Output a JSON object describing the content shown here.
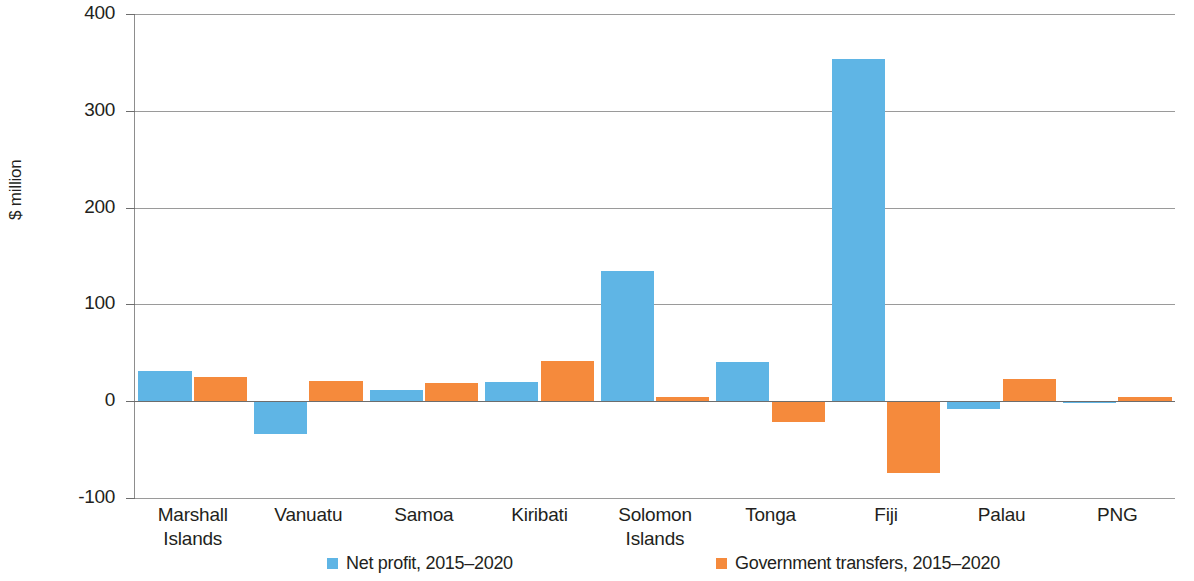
{
  "chart_data": {
    "type": "bar",
    "title": "",
    "subtitle": "",
    "xlabel": "",
    "ylabel": "$ million",
    "ylim": [
      -100,
      400
    ],
    "yticks": [
      400,
      300,
      200,
      100,
      0,
      -100
    ],
    "ytick_labels": [
      "400",
      "300",
      "200",
      "100",
      "0",
      "-100"
    ],
    "grid": true,
    "legend_position": "bottom",
    "categories": [
      "Marshall Islands",
      "Vanuatu",
      "Samoa",
      "Kiribati",
      "Solomon Islands",
      "Tonga",
      "Fiji",
      "Palau",
      "PNG"
    ],
    "category_lines": [
      [
        "Marshall",
        "Islands"
      ],
      [
        "Vanuatu"
      ],
      [
        "Samoa"
      ],
      [
        "Kiribati"
      ],
      [
        "Solomon",
        "Islands"
      ],
      [
        "Tonga"
      ],
      [
        "Fiji"
      ],
      [
        "Palau"
      ],
      [
        "PNG"
      ]
    ],
    "series": [
      {
        "name": "Net profit, 2015–2020",
        "color": "#5fb5e5",
        "values": [
          31,
          -34,
          12,
          20,
          134,
          41,
          353,
          -8,
          -1
        ]
      },
      {
        "name": "Government transfers, 2015–2020",
        "color": "#f58a3c",
        "values": [
          25,
          21,
          19,
          42,
          4,
          -21,
          -74,
          23,
          4
        ]
      }
    ]
  },
  "legend": {
    "items": [
      {
        "label": "Net profit, 2015–2020",
        "color": "#5fb5e5"
      },
      {
        "label": "Government transfers, 2015–2020",
        "color": "#f58a3c"
      }
    ]
  },
  "colors": {
    "net_profit": "#5fb5e5",
    "government_transfers": "#f58a3c",
    "axis": "#6d6d6d",
    "gridline": "#9a9a9a",
    "text": "#231f20"
  }
}
